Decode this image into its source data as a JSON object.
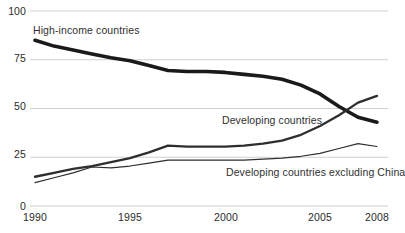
{
  "chart_data": {
    "type": "line",
    "title": "",
    "subtitle": "",
    "xlabel": "",
    "ylabel": "",
    "xlim": [
      1990,
      2008
    ],
    "ylim": [
      0,
      100
    ],
    "grid": true,
    "legend_position": "inline-annotations",
    "y_ticks": [
      "0",
      "25",
      "50",
      "75",
      "100"
    ],
    "y_tick_values": [
      0,
      25,
      50,
      75,
      100
    ],
    "x_ticks": [
      "1990",
      "1995",
      "2000",
      "2005",
      "2008"
    ],
    "x_tick_values": [
      1990,
      1995,
      2000,
      2005,
      2008
    ],
    "x": [
      1990,
      1991,
      1992,
      1993,
      1994,
      1995,
      1996,
      1997,
      1998,
      1999,
      2000,
      2001,
      2002,
      2003,
      2004,
      2005,
      2006,
      2007,
      2008
    ],
    "series": [
      {
        "name": "High-income countries",
        "color": "#1a1a1a",
        "line_width": 3.6,
        "values": [
          85,
          82,
          80,
          78,
          76,
          74.5,
          72,
          69.5,
          69,
          69,
          68.5,
          67.5,
          66.5,
          65,
          62,
          57.5,
          51,
          45.5,
          43
        ]
      },
      {
        "name": "Developing countries",
        "color": "#2e2e2e",
        "line_width": 2.3,
        "values": [
          15,
          17,
          19,
          20.5,
          22.5,
          24.5,
          27.5,
          31,
          30.5,
          30.5,
          30.5,
          31,
          32,
          33.5,
          36.5,
          41,
          46.5,
          53,
          56.5
        ]
      },
      {
        "name": "Developing countries excluding China",
        "color": "#2e2e2e",
        "line_width": 1.2,
        "values": [
          12,
          14.5,
          17,
          20,
          19.5,
          20.5,
          22,
          23.5,
          23.5,
          23.5,
          23.5,
          23.5,
          24,
          24.5,
          25.5,
          27,
          29.5,
          32,
          30.5
        ]
      }
    ],
    "annotations": [
      {
        "text": "High-income countries",
        "x_px": 33,
        "y_px": 24
      },
      {
        "text": "Developing countries",
        "x_px": 222,
        "y_px": 114
      },
      {
        "text": "Developing countries excluding China",
        "x_px": 226,
        "y_px": 166
      }
    ]
  },
  "axis": {
    "y_label_0": "0",
    "y_label_25": "25",
    "y_label_50": "50",
    "y_label_75": "75",
    "y_label_100": "100",
    "x_label_1990": "1990",
    "x_label_1995": "1995",
    "x_label_2000": "2000",
    "x_label_2005": "2005",
    "x_label_2008": "2008"
  },
  "colors": {
    "gridline": "#c9c9c9",
    "axis_text": "#2b2b2b",
    "series_high_income": "#1a1a1a",
    "series_developing": "#2e2e2e",
    "background": "#ffffff"
  }
}
